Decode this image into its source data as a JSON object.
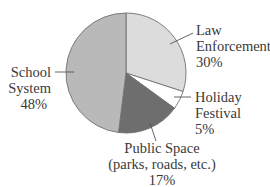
{
  "chart_data": {
    "type": "pie",
    "title": "",
    "categories": [
      "Law Enforcement",
      "Holiday Festival",
      "Public Space (parks, roads, etc.)",
      "School System"
    ],
    "values": [
      30,
      5,
      17,
      48
    ],
    "units": "%",
    "start_angle_deg": 0,
    "direction": "clockwise",
    "colors": [
      "#dcdcdc",
      "#ffffff",
      "#6e6e6e",
      "#b9b9b9"
    ],
    "legend": "none (direct labels with leader lines)"
  },
  "labels": {
    "law_enforcement": {
      "line1": "Law",
      "line2": "Enforcement",
      "pct": "30%"
    },
    "holiday_festival": {
      "line1": "Holiday",
      "line2": "Festival",
      "pct": "5%"
    },
    "public_space": {
      "line1": "Public Space",
      "line2": "(parks, roads, etc.)",
      "pct": "17%"
    },
    "school_system": {
      "line1": "School",
      "line2": "System",
      "pct": "48%"
    }
  }
}
